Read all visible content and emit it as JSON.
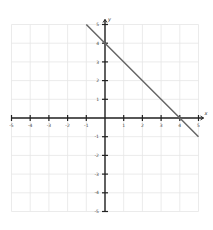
{
  "chart_data": {
    "type": "line",
    "title": "",
    "xlabel": "x",
    "ylabel": "y",
    "xlim": [
      -5,
      5
    ],
    "ylim": [
      -5,
      5
    ],
    "grid": true,
    "x_ticks": [
      -5,
      -4,
      -3,
      -2,
      -1,
      1,
      2,
      3,
      4,
      5
    ],
    "y_ticks": [
      -5,
      -4,
      -3,
      -2,
      -1,
      1,
      2,
      3,
      4,
      5
    ],
    "series": [
      {
        "name": "y = -x + 4",
        "equation": "y = -x + 4",
        "color": "#666666",
        "x": [
          -1,
          0,
          4,
          5
        ],
        "y": [
          5,
          4,
          0,
          -1
        ]
      }
    ],
    "key_points": [
      {
        "label": "y-intercept",
        "x": 0,
        "y": 4
      },
      {
        "label": "x-intercept",
        "x": 4,
        "y": 0
      }
    ]
  },
  "colors": {
    "axis": "#222222",
    "grid": "#e6e6e6",
    "line": "#666666",
    "background": "#ffffff"
  }
}
